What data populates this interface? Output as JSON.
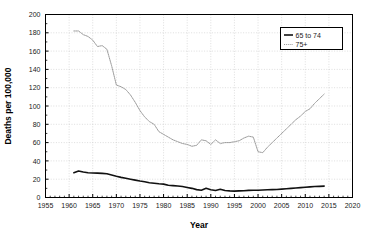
{
  "chart_data": {
    "type": "line",
    "title": "",
    "xlabel": "Year",
    "ylabel": "Deaths per 100,000",
    "xlim": [
      1955,
      2020
    ],
    "ylim": [
      0,
      200
    ],
    "xticks": [
      1955,
      1960,
      1965,
      1970,
      1975,
      1980,
      1985,
      1990,
      1995,
      2000,
      2005,
      2010,
      2015,
      2020
    ],
    "yticks": [
      0,
      20,
      40,
      60,
      80,
      100,
      120,
      140,
      160,
      180,
      200
    ],
    "grid": true,
    "legend_position": "top-right",
    "series": [
      {
        "name": "65 to 74",
        "color": "#111111",
        "style": "solid",
        "x": [
          1961,
          1962,
          1963,
          1964,
          1965,
          1966,
          1967,
          1968,
          1969,
          1970,
          1971,
          1972,
          1973,
          1974,
          1975,
          1976,
          1977,
          1978,
          1979,
          1980,
          1981,
          1982,
          1983,
          1984,
          1985,
          1986,
          1987,
          1988,
          1989,
          1990,
          1991,
          1992,
          1993,
          1994,
          1995,
          1996,
          1997,
          1998,
          1999,
          2000,
          2001,
          2002,
          2003,
          2004,
          2005,
          2006,
          2007,
          2008,
          2009,
          2010,
          2011,
          2012,
          2013,
          2014
        ],
        "y": [
          27.0,
          29.0,
          27.8,
          27.0,
          26.8,
          26.6,
          26.4,
          26.0,
          24.6,
          23.2,
          22.0,
          21.0,
          20.0,
          19.0,
          18.0,
          17.2,
          16.2,
          15.6,
          15.0,
          14.6,
          13.4,
          13.0,
          12.6,
          12.0,
          11.0,
          10.0,
          8.6,
          8.0,
          10.0,
          8.4,
          7.6,
          9.0,
          7.6,
          7.2,
          7.0,
          7.2,
          7.4,
          7.8,
          8.0,
          8.0,
          8.2,
          8.4,
          8.6,
          8.8,
          9.2,
          9.6,
          10.0,
          10.4,
          10.8,
          11.2,
          11.6,
          12.0,
          12.2,
          12.4
        ]
      },
      {
        "name": "75+",
        "color": "#9a9a9a",
        "style": "dotted",
        "x": [
          1961,
          1962,
          1963,
          1964,
          1965,
          1966,
          1967,
          1968,
          1969,
          1970,
          1971,
          1972,
          1973,
          1974,
          1975,
          1976,
          1977,
          1978,
          1979,
          1980,
          1981,
          1982,
          1983,
          1984,
          1985,
          1986,
          1987,
          1988,
          1989,
          1990,
          1991,
          1992,
          1993,
          1994,
          1995,
          1996,
          1997,
          1998,
          1999,
          2000,
          2001,
          2002,
          2003,
          2004,
          2005,
          2006,
          2007,
          2008,
          2009,
          2010,
          2011,
          2012,
          2013,
          2014
        ],
        "y": [
          182.0,
          182.0,
          178.0,
          176.0,
          172.0,
          165.0,
          166.0,
          162.0,
          144.0,
          123.0,
          121.0,
          118.0,
          112.0,
          104.0,
          95.0,
          88.0,
          83.0,
          80.0,
          72.0,
          69.0,
          66.0,
          63.0,
          61.0,
          59.0,
          58.0,
          56.0,
          57.0,
          63.0,
          62.0,
          58.0,
          63.0,
          59.0,
          60.0,
          60.0,
          61.0,
          62.0,
          65.0,
          67.0,
          66.0,
          50.0,
          49.0,
          55.0,
          60.0,
          65.0,
          70.0,
          75.0,
          80.0,
          85.0,
          89.0,
          94.0,
          97.0,
          103.0,
          108.0,
          113.0
        ]
      }
    ],
    "legend": [
      {
        "label": "65 to 74",
        "style": "solid",
        "color": "#111111"
      },
      {
        "label": "75+",
        "style": "dotted",
        "color": "#9a9a9a"
      }
    ]
  }
}
